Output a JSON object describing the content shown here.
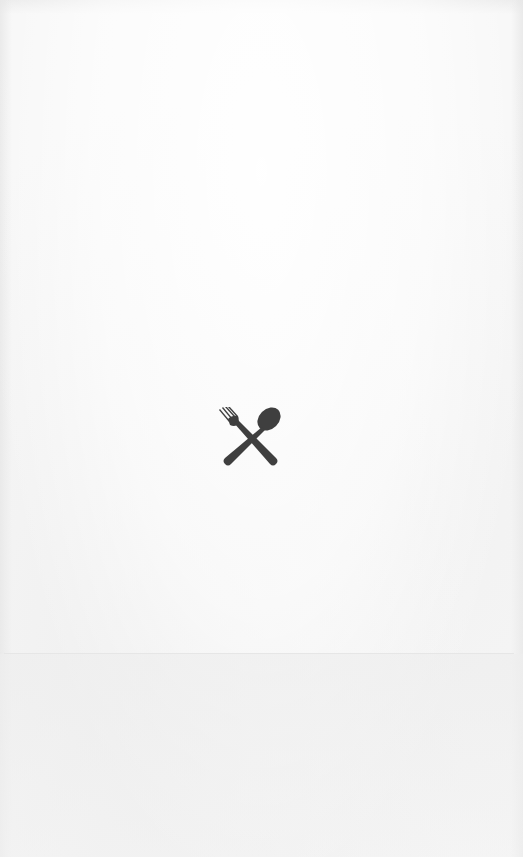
{
  "screen": {
    "type": "splash",
    "background_color": "#f7f7f7",
    "divider_color": "#e6e6e6"
  },
  "logo": {
    "icon": "fork-and-spoon-crossed-icon",
    "color": "#3f3f3f"
  }
}
